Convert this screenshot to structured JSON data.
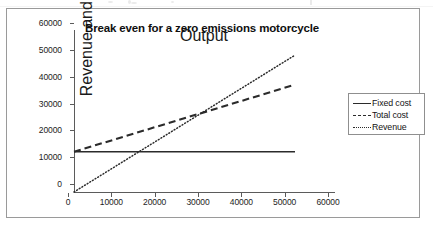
{
  "chart_data": {
    "type": "line",
    "title": "Break even for a zero emissions motorcycle",
    "xlabel": "Output",
    "ylabel": "Revenue and Cost (£)",
    "xlim": [
      0,
      60000
    ],
    "ylim": [
      0,
      60000
    ],
    "xticks": [
      "0",
      "10000",
      "20000",
      "30000",
      "40000",
      "50000",
      "60000"
    ],
    "yticks": [
      "0",
      "10000",
      "20000",
      "30000",
      "40000",
      "50000",
      "60000"
    ],
    "xtick_values": [
      0,
      10000,
      20000,
      30000,
      40000,
      50000,
      60000
    ],
    "ytick_values": [
      0,
      10000,
      20000,
      30000,
      40000,
      50000,
      60000
    ],
    "grid": false,
    "legend_position": "right",
    "series": [
      {
        "name": "Fixed cost",
        "style": "solid",
        "color": "#2b2b2b",
        "x": [
          0,
          51000
        ],
        "y": [
          15000,
          15000
        ]
      },
      {
        "name": "Total cost",
        "style": "dashed",
        "color": "#2b2b2b",
        "x": [
          0,
          51000
        ],
        "y": [
          15000,
          40000
        ]
      },
      {
        "name": "Revenue",
        "style": "dotted",
        "color": "#2b2b2b",
        "x": [
          0,
          51000
        ],
        "y": [
          0,
          51000
        ]
      }
    ],
    "break_even": {
      "x": 30000,
      "y": 30000
    }
  },
  "legend": {
    "items": [
      {
        "label": "Fixed cost"
      },
      {
        "label": "Total cost"
      },
      {
        "label": "Revenue"
      }
    ]
  }
}
